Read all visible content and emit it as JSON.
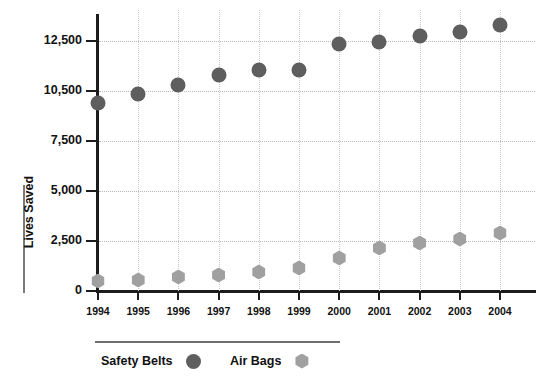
{
  "chart_data": {
    "type": "scatter",
    "title": "",
    "xlabel": "",
    "ylabel": "Lives Saved",
    "categories": [
      "1994",
      "1995",
      "1996",
      "1997",
      "1998",
      "1999",
      "2000",
      "2001",
      "2002",
      "2003",
      "2004"
    ],
    "y_ticks": [
      "0",
      "2,500",
      "5,000",
      "7,500",
      "10,500",
      "12,500"
    ],
    "y_tick_values": [
      0,
      2500,
      5000,
      7500,
      10500,
      12500
    ],
    "ylim": [
      0,
      13500
    ],
    "grid": "dotted both axes",
    "legend_position": "bottom-left",
    "series": [
      {
        "name": "Safety Belts",
        "marker": "circle",
        "color": "#5e5e5e",
        "values": [
          9800,
          10350,
          10750,
          11150,
          11350,
          11350,
          12400,
          12450,
          12700,
          12850,
          13150
        ]
      },
      {
        "name": "Air Bags",
        "marker": "hexagon",
        "color": "#a0a0a0",
        "values": [
          500,
          550,
          700,
          800,
          950,
          1150,
          1650,
          2150,
          2400,
          2600,
          2900
        ]
      }
    ]
  },
  "axis": {
    "y_title": "Lives Saved"
  },
  "legend": {
    "entries": [
      {
        "label": "Safety Belts",
        "swatch": "circle-marker-icon"
      },
      {
        "label": "Air Bags",
        "swatch": "hexagon-marker-icon"
      }
    ]
  }
}
